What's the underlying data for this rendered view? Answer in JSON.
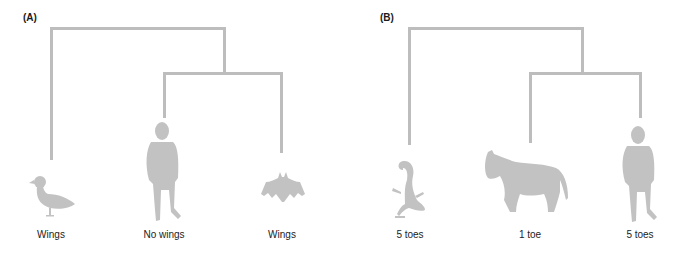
{
  "panels": [
    {
      "id": "A",
      "label": "(A)",
      "taxa": [
        {
          "name": "duck",
          "label": "Wings"
        },
        {
          "name": "human",
          "label": "No wings"
        },
        {
          "name": "bat",
          "label": "Wings"
        }
      ]
    },
    {
      "id": "B",
      "label": "(B)",
      "taxa": [
        {
          "name": "lizard",
          "label": "5 toes"
        },
        {
          "name": "horse",
          "label": "1 toe"
        },
        {
          "name": "human",
          "label": "5 toes"
        }
      ]
    }
  ],
  "colors": {
    "branch": "#bdbdbd",
    "silhouette": "#c2c2c2",
    "text": "#222222"
  }
}
